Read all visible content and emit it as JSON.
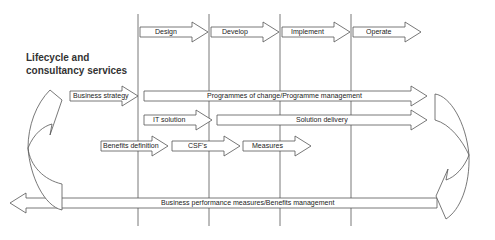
{
  "title": {
    "line1": "Lifecycle and",
    "line2": "consultancy services"
  },
  "phases": [
    {
      "label": "Design"
    },
    {
      "label": "Develop"
    },
    {
      "label": "Implement"
    },
    {
      "label": "Operate"
    }
  ],
  "rows": {
    "business_strategy": "Business strategy",
    "programmes": "Programmes of change/Programme management",
    "it_solution": "IT solution",
    "solution_delivery": "Solution delivery",
    "benefits_definition": "Benefits definition",
    "csfs": "CSF's",
    "measures": "Measures",
    "business_performance": "Business performance measures/Benefits management"
  },
  "colors": {
    "stroke": "#555555",
    "fill": "#ffffff",
    "text": "#222222"
  }
}
